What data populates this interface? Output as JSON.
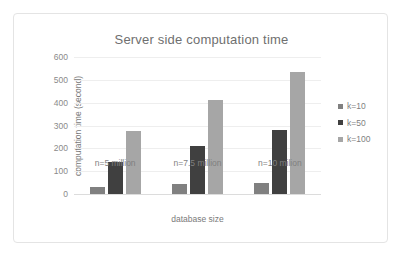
{
  "chart_data": {
    "type": "bar",
    "title": "Server side computation time",
    "xlabel": "database size",
    "ylabel": "computation time (second)",
    "categories": [
      "n=5 million",
      "n=7.5 million",
      "n=10 milion"
    ],
    "series": [
      {
        "name": "k=10",
        "values": [
          30,
          45,
          50
        ],
        "color": "#808080"
      },
      {
        "name": "k=50",
        "values": [
          140,
          210,
          280
        ],
        "color": "#404040"
      },
      {
        "name": "k=100",
        "values": [
          275,
          410,
          535
        ],
        "color": "#a6a6a6"
      }
    ],
    "ylim": [
      0,
      600
    ],
    "yticks": [
      600,
      500,
      400,
      300,
      200,
      100,
      0
    ],
    "ytick_labels": [
      "600",
      "500",
      "400",
      "300",
      "200",
      "100",
      "0"
    ],
    "grid": true,
    "legend_position": "right"
  },
  "legend": {
    "items": [
      {
        "label": "k=10"
      },
      {
        "label": "k=50"
      },
      {
        "label": "k=100"
      }
    ]
  }
}
